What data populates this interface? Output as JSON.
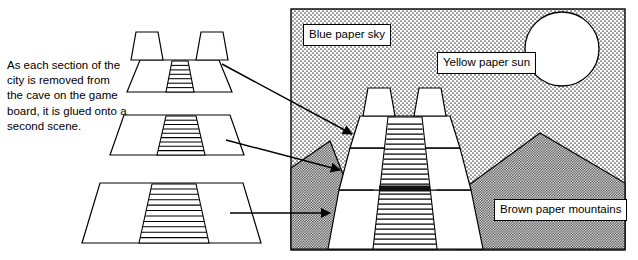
{
  "figure": {
    "kind": "instructional-diagram",
    "title_visible": false,
    "background_color": "#ffffff",
    "line_color": "#000000"
  },
  "caption": {
    "text": "As each section of the city is removed from the cave on the game board, it is glued onto a second scene."
  },
  "left_pieces": [
    {
      "name": "city-section-top",
      "description": "Small trapezoid platform with two towers and a narrow staircase",
      "step_count": 7,
      "tower_count": 2
    },
    {
      "name": "city-section-middle",
      "description": "Medium trapezoid platform with a staircase",
      "step_count": 9,
      "tower_count": 0
    },
    {
      "name": "city-section-bottom",
      "description": "Large trapezoid platform with a wide staircase",
      "step_count": 12,
      "tower_count": 0
    }
  ],
  "arrows": [
    {
      "name": "arrow-top-section",
      "from_piece": "city-section-top",
      "to": "pyramid-tier-top"
    },
    {
      "name": "arrow-middle-section",
      "from_piece": "city-section-middle",
      "to": "pyramid-tier-middle"
    },
    {
      "name": "arrow-bottom-section",
      "from_piece": "city-section-bottom",
      "to": "pyramid-tier-bottom"
    }
  ],
  "scene": {
    "frame": {
      "x": 291,
      "y": 9,
      "width": 334,
      "height": 241
    },
    "labels": {
      "sky": "Blue paper sky",
      "sun": "Yellow paper sun",
      "mountains": "Brown paper mountains"
    },
    "elements": [
      {
        "name": "sky",
        "fill": "light dotted stipple",
        "label": "Blue paper sky"
      },
      {
        "name": "sun",
        "shape": "circle",
        "fill": "#ffffff",
        "label": "Yellow paper sun"
      },
      {
        "name": "mountains",
        "fill": "dense dotted stipple",
        "label": "Brown paper mountains"
      },
      {
        "name": "pyramid",
        "tiers": 3,
        "towers": 2,
        "description": "Assembled stepped pyramid made of the three glued city sections"
      }
    ]
  }
}
